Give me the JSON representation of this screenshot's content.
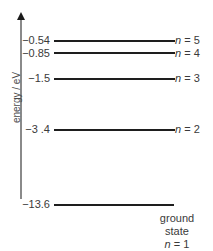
{
  "diagram": {
    "type": "energy-level-diagram",
    "axis_label": "energy / eV",
    "levels": [
      {
        "n": 5,
        "energy": "−0.54",
        "n_symbol": "n",
        "n_value": "= 5",
        "y": 40
      },
      {
        "n": 4,
        "energy": "−0.85",
        "n_symbol": "n",
        "n_value": "= 4",
        "y": 52
      },
      {
        "n": 3,
        "energy": "−1.5",
        "n_symbol": "n",
        "n_value": "= 3",
        "y": 78
      },
      {
        "n": 2,
        "energy": "−3 .4",
        "n_symbol": "n",
        "n_value": "= 2",
        "y": 129
      },
      {
        "n": 1,
        "energy": "−13.6",
        "n_symbol": "n",
        "n_value": "= 1",
        "y": 204
      }
    ],
    "ground_state_label": "ground state"
  }
}
